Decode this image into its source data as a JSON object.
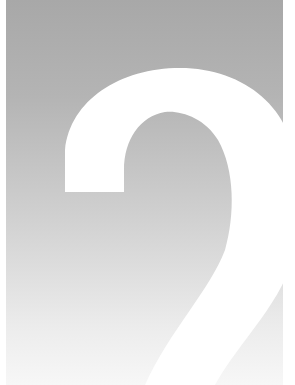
{
  "cover": {
    "numeral": "2",
    "background_gradient": {
      "top": "#a8a8a8",
      "bottom": "#f7f7f7"
    },
    "numeral_color": "#ffffff"
  }
}
